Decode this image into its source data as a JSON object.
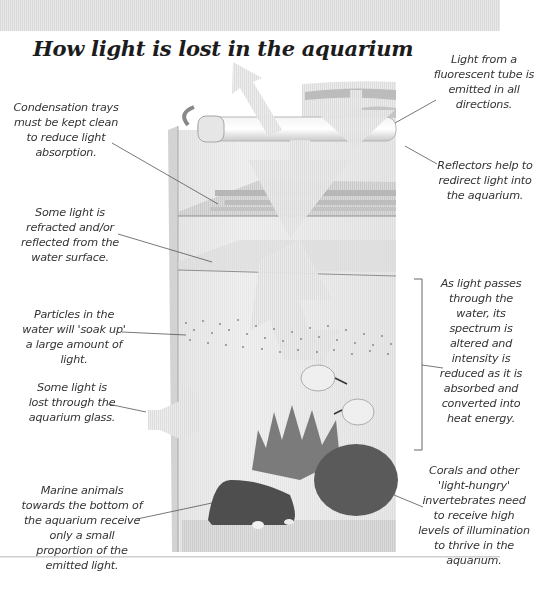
{
  "title": "How light is lost in the aquarium",
  "callouts": {
    "tube": "Light from a fluorescent tube is emitted in all directions.",
    "condensation": "Condensation trays must be kept clean to reduce light absorption.",
    "reflectors": "Reflectors help to redirect light into the aquarium.",
    "surface": "Some light is refracted and/or reflected from the water surface.",
    "particles": "Particles in the water will 'soak up' a large amount of light.",
    "spectrum": "As light passes through the water, its spectrum is altered and intensity is reduced as it is absorbed and converted into heat energy.",
    "glass": "Some light is lost through the aquarium glass.",
    "bottom": "Marine animals towards the bottom of the aquarium receive only a small proportion of the emitted light.",
    "corals": "Corals and other 'light-hungry' invertebrates need to receive high levels of illumination to thrive in the aquarium."
  },
  "colors": {
    "arrow": "#d6d6d6",
    "glass": "#e9e9e9",
    "coral": "#6b6b6b",
    "leader": "#555555"
  }
}
